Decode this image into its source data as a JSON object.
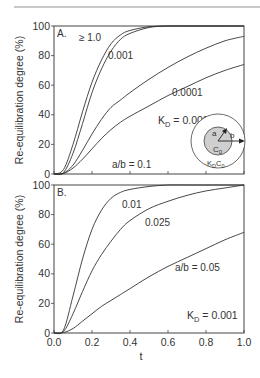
{
  "figure": {
    "y_label": "Re-equilibration degree (%)",
    "x_label": "t",
    "y_ticks": [
      "0",
      "20",
      "40",
      "60",
      "80",
      "100"
    ],
    "x_ticks": [
      "0.0",
      "0.2",
      "0.4",
      "0.6",
      "0.8",
      "1.0"
    ]
  },
  "panel_a": {
    "label": "A.",
    "param_note": "a/b = 0.1",
    "curve_labels": [
      "≥ 1.0",
      "0.001",
      "0.0001",
      "K_D = 0.00005"
    ],
    "kd_prefix": "K",
    "kd_sub": "D",
    "kd_value": " = 0.00005",
    "inset": {
      "a_label": "a",
      "b_label": "b",
      "inner_label_main": "C",
      "inner_label_sub": "0",
      "outer_label_main": "K",
      "outer_label_sub1": "D",
      "outer_label_mid": "C",
      "outer_label_sub2": "0"
    }
  },
  "panel_b": {
    "label": "B.",
    "kd_prefix": "K",
    "kd_sub": "D",
    "kd_value": " = 0.001",
    "curve_labels": [
      "0.01",
      "0.025",
      "a/b = 0.05"
    ]
  },
  "chart_data": [
    {
      "type": "line",
      "title": "A.",
      "xlabel": "t",
      "ylabel": "Re-equilibration degree (%)",
      "xlim": [
        0,
        1.0
      ],
      "ylim": [
        0,
        100
      ],
      "grid": false,
      "annotations": [
        "a/b = 0.1",
        "inset: concentric circles, radii a and b, inner C0, outer KD·C0"
      ],
      "x": [
        0.0,
        0.05,
        0.1,
        0.15,
        0.2,
        0.25,
        0.3,
        0.35,
        0.4,
        0.5,
        0.6,
        0.7,
        0.8,
        0.9,
        1.0
      ],
      "series": [
        {
          "name": "KD ≥ 1.0",
          "values": [
            0,
            3,
            20,
            42,
            62,
            77,
            88,
            94,
            97,
            99.5,
            100,
            100,
            100,
            100,
            100
          ]
        },
        {
          "name": "KD = 0.001",
          "values": [
            0,
            1,
            14,
            34,
            55,
            71,
            83,
            91,
            95,
            99,
            100,
            100,
            100,
            100,
            100
          ]
        },
        {
          "name": "KD = 0.0001",
          "values": [
            0,
            0.5,
            6,
            16,
            27,
            37,
            45,
            50,
            55,
            64,
            72,
            79,
            85,
            90,
            93
          ]
        },
        {
          "name": "KD = 0.00005",
          "values": [
            0,
            0.3,
            4,
            10,
            17,
            24,
            30,
            35,
            39,
            46,
            53,
            59,
            65,
            70,
            74
          ]
        }
      ]
    },
    {
      "type": "line",
      "title": "B.",
      "xlabel": "t",
      "ylabel": "Re-equilibration degree (%)",
      "xlim": [
        0,
        1.0
      ],
      "ylim": [
        0,
        100
      ],
      "grid": false,
      "annotations": [
        "KD = 0.001"
      ],
      "x": [
        0.0,
        0.05,
        0.1,
        0.15,
        0.2,
        0.25,
        0.3,
        0.35,
        0.4,
        0.5,
        0.6,
        0.7,
        0.8,
        0.9,
        1.0
      ],
      "series": [
        {
          "name": "a/b = 0.01",
          "values": [
            0,
            2,
            25,
            50,
            70,
            83,
            91,
            95,
            97,
            99,
            100,
            100,
            100,
            100,
            100
          ]
        },
        {
          "name": "a/b = 0.025",
          "values": [
            0,
            1,
            13,
            28,
            42,
            53,
            62,
            70,
            76,
            84,
            89,
            93,
            96,
            98,
            100
          ]
        },
        {
          "name": "a/b = 0.05",
          "values": [
            0,
            0.3,
            3,
            8,
            13,
            18,
            22,
            26,
            30,
            38,
            45,
            51,
            57,
            63,
            68
          ]
        }
      ]
    }
  ]
}
